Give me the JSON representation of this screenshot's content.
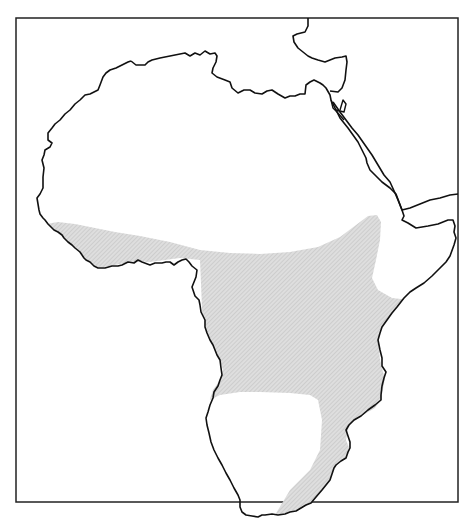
{
  "map": {
    "subject": "Africa",
    "style": "black-and-white outline map",
    "colors": {
      "background": "#ffffff",
      "coastline": "#111111",
      "frame": "#222222",
      "shaded_region": "#d9d9d9",
      "hatch": "#bdbdbd"
    },
    "layers": [
      {
        "name": "frame",
        "description": "rectangular map border"
      },
      {
        "name": "africa-coastline",
        "description": "outline of the African continent"
      },
      {
        "name": "arabian-peninsula-coast",
        "description": "partial coastline of Arabia across the Red Sea"
      },
      {
        "name": "europe-coast",
        "description": "partial Mediterranean coastline of Europe at top"
      },
      {
        "name": "shaded-range",
        "description": "stippled grey region covering sub-Saharan Africa from West Africa to the Horn and down the east side, excluding the southwest"
      }
    ],
    "labels": []
  }
}
